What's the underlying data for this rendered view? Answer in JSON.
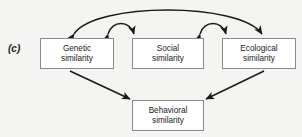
{
  "figure": {
    "panel_label": "(c)",
    "background_color": "#f4f4f2",
    "box_border_color": "#8a8a8a",
    "box_fill_color": "#ffffff",
    "arrow_color": "#1a1a1a"
  },
  "nodes": {
    "genetic": {
      "line1": "Genetic",
      "line2": "similarity"
    },
    "social": {
      "line1": "Social",
      "line2": "similarity"
    },
    "ecological": {
      "line1": "Ecological",
      "line2": "similarity"
    },
    "behavioral": {
      "line1": "Behavioral",
      "line2": "similarity"
    }
  },
  "edges": [
    {
      "id": "genetic-social",
      "from": "genetic",
      "to": "social",
      "style": "curved-arc",
      "heads": "double"
    },
    {
      "id": "social-ecological",
      "from": "social",
      "to": "ecological",
      "style": "curved-arc",
      "heads": "double"
    },
    {
      "id": "genetic-ecological",
      "from": "genetic",
      "to": "ecological",
      "style": "curved-arc-large",
      "heads": "double"
    },
    {
      "id": "genetic-behavioral",
      "from": "genetic",
      "to": "behavioral",
      "style": "straight",
      "heads": "single"
    },
    {
      "id": "ecological-behavioral",
      "from": "ecological",
      "to": "behavioral",
      "style": "straight",
      "heads": "single"
    }
  ]
}
